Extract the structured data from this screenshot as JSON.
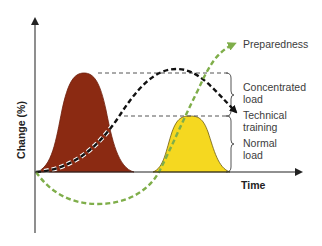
{
  "diagram": {
    "type": "training-load-periodization",
    "y_axis_label": "Change (%)",
    "x_axis_label": "Time",
    "curves": [
      {
        "name": "Concentrated load",
        "shape": "filled bell",
        "color": "#8b2a12",
        "peak": "high"
      },
      {
        "name": "Normal load",
        "shape": "filled bell",
        "color": "#f5d820",
        "peak": "medium"
      },
      {
        "name": "Technical training",
        "shape": "black dashed curve with arrow",
        "color": "#111111"
      },
      {
        "name": "Preparedness",
        "shape": "green dashed curve with arrow",
        "color": "#7fae4a"
      }
    ],
    "labels": {
      "preparedness": "Preparedness",
      "concentrated_line1": "Concentrated",
      "concentrated_line2": "load",
      "technical_line1": "Technical",
      "technical_line2": "training",
      "normal_line1": "Normal",
      "normal_line2": "load"
    },
    "colors": {
      "concentrated_fill": "#8b2a12",
      "normal_fill": "#f5d820",
      "technical_line": "#111111",
      "preparedness_line": "#7fae4a",
      "guide_line": "#555555",
      "axis": "#444444"
    }
  }
}
